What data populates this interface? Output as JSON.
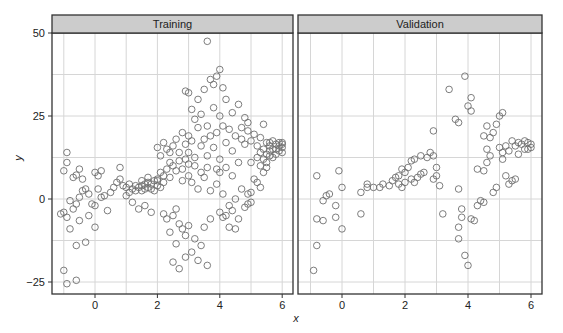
{
  "chart_data": {
    "type": "scatter",
    "title": "",
    "xlabel": "x",
    "ylabel": "y",
    "xlim": [
      -1.3,
      6.3
    ],
    "ylim": [
      -30,
      51
    ],
    "x_ticks": [
      0,
      2,
      4,
      6
    ],
    "y_ticks": [
      -25,
      0,
      25,
      50
    ],
    "grid": true,
    "legend": null,
    "panels": [
      {
        "name": "Training",
        "points": [
          [
            -1.0,
            8.5
          ],
          [
            -0.9,
            14.0
          ],
          [
            -0.9,
            11.0
          ],
          [
            -0.7,
            6.5
          ],
          [
            -0.6,
            7.2
          ],
          [
            -0.5,
            9.0
          ],
          [
            -0.4,
            6.0
          ],
          [
            -0.8,
            -0.5
          ],
          [
            -0.6,
            -1.5
          ],
          [
            -0.5,
            0.5
          ],
          [
            -1.0,
            -4.0
          ],
          [
            -1.1,
            -4.5
          ],
          [
            -0.9,
            -5.5
          ],
          [
            -0.7,
            -3.0
          ],
          [
            -0.5,
            -6.5
          ],
          [
            -0.8,
            -9.0
          ],
          [
            -0.6,
            -14.0
          ],
          [
            -0.3,
            -13.0
          ],
          [
            -1.0,
            -21.5
          ],
          [
            -0.9,
            -25.5
          ],
          [
            -0.6,
            -24.5
          ],
          [
            -0.4,
            2.5
          ],
          [
            -0.3,
            3.0
          ],
          [
            -0.2,
            1.5
          ],
          [
            -0.1,
            -1.5
          ],
          [
            0.0,
            -2.0
          ],
          [
            0.0,
            8.0
          ],
          [
            0.1,
            7.0
          ],
          [
            0.2,
            8.5
          ],
          [
            0.1,
            3.0
          ],
          [
            -0.2,
            -5.0
          ],
          [
            0.0,
            -8.5
          ],
          [
            0.2,
            0.5
          ],
          [
            0.3,
            1.0
          ],
          [
            0.4,
            -3.5
          ],
          [
            0.5,
            2.0
          ],
          [
            0.6,
            3.5
          ],
          [
            0.7,
            5.0
          ],
          [
            0.8,
            6.0
          ],
          [
            0.9,
            4.0
          ],
          [
            0.8,
            9.5
          ],
          [
            1.0,
            1.0
          ],
          [
            1.1,
            2.0
          ],
          [
            1.2,
            3.0
          ],
          [
            1.3,
            2.5
          ],
          [
            1.4,
            3.5
          ],
          [
            1.5,
            4.0
          ],
          [
            1.6,
            3.0
          ],
          [
            1.7,
            5.0
          ],
          [
            1.8,
            4.5
          ],
          [
            1.2,
            -1.0
          ],
          [
            1.4,
            -3.0
          ],
          [
            1.6,
            -2.0
          ],
          [
            1.8,
            -4.0
          ],
          [
            1.7,
            6.5
          ],
          [
            1.9,
            5.5
          ],
          [
            2.0,
            6.0
          ],
          [
            2.0,
            4.0
          ],
          [
            2.1,
            3.5
          ],
          [
            2.2,
            5.0
          ],
          [
            2.1,
            8.0
          ],
          [
            2.2,
            7.0
          ],
          [
            2.3,
            9.0
          ],
          [
            2.4,
            6.5
          ],
          [
            2.5,
            10.0
          ],
          [
            2.6,
            8.5
          ],
          [
            2.7,
            11.5
          ],
          [
            2.8,
            9.0
          ],
          [
            2.9,
            12.0
          ],
          [
            3.0,
            10.5
          ],
          [
            2.1,
            13.0
          ],
          [
            2.3,
            15.0
          ],
          [
            2.2,
            17.0
          ],
          [
            2.4,
            14.0
          ],
          [
            2.6,
            18.0
          ],
          [
            2.8,
            20.0
          ],
          [
            2.9,
            16.5
          ],
          [
            3.0,
            19.0
          ],
          [
            2.0,
            15.5
          ],
          [
            2.5,
            16.0
          ],
          [
            2.2,
            -4.5
          ],
          [
            2.3,
            -6.0
          ],
          [
            2.5,
            -5.0
          ],
          [
            2.6,
            -3.0
          ],
          [
            2.7,
            -7.5
          ],
          [
            2.8,
            -9.0
          ],
          [
            2.4,
            -10.0
          ],
          [
            2.6,
            -13.5
          ],
          [
            2.9,
            -11.0
          ],
          [
            3.0,
            -8.0
          ],
          [
            2.5,
            -19.0
          ],
          [
            2.7,
            -21.0
          ],
          [
            2.9,
            -17.5
          ],
          [
            3.1,
            -16.0
          ],
          [
            3.2,
            -12.0
          ],
          [
            3.3,
            -18.5
          ],
          [
            3.4,
            -14.0
          ],
          [
            3.6,
            -20.0
          ],
          [
            3.5,
            -8.5
          ],
          [
            3.7,
            -6.0
          ],
          [
            2.9,
            32.5
          ],
          [
            3.0,
            32.0
          ],
          [
            3.3,
            30.0
          ],
          [
            3.5,
            33.0
          ],
          [
            3.6,
            47.5
          ],
          [
            3.7,
            36.0
          ],
          [
            3.9,
            37.0
          ],
          [
            4.0,
            39.0
          ],
          [
            3.8,
            34.5
          ],
          [
            4.1,
            33.5
          ],
          [
            3.1,
            27.0
          ],
          [
            3.2,
            24.0
          ],
          [
            3.4,
            25.5
          ],
          [
            3.6,
            22.0
          ],
          [
            3.8,
            27.5
          ],
          [
            4.0,
            25.0
          ],
          [
            4.2,
            30.0
          ],
          [
            4.4,
            26.0
          ],
          [
            4.6,
            28.5
          ],
          [
            4.8,
            24.5
          ],
          [
            3.0,
            14.0
          ],
          [
            3.2,
            12.5
          ],
          [
            3.4,
            16.0
          ],
          [
            3.6,
            13.0
          ],
          [
            3.8,
            15.5
          ],
          [
            4.0,
            12.0
          ],
          [
            4.2,
            17.0
          ],
          [
            4.4,
            14.5
          ],
          [
            4.6,
            11.0
          ],
          [
            4.8,
            16.5
          ],
          [
            3.1,
            5.0
          ],
          [
            3.3,
            3.0
          ],
          [
            3.5,
            6.5
          ],
          [
            3.7,
            2.5
          ],
          [
            3.9,
            4.5
          ],
          [
            4.1,
            1.5
          ],
          [
            4.3,
            -2.0
          ],
          [
            4.5,
            0.0
          ],
          [
            4.7,
            3.0
          ],
          [
            4.9,
            -1.5
          ],
          [
            4.0,
            -4.0
          ],
          [
            4.2,
            -5.0
          ],
          [
            4.4,
            -3.5
          ],
          [
            4.6,
            -6.0
          ],
          [
            4.5,
            -9.0
          ],
          [
            4.3,
            -8.5
          ],
          [
            4.1,
            -5.5
          ],
          [
            4.8,
            -2.5
          ],
          [
            5.0,
            -1.0
          ],
          [
            4.9,
            1.5
          ],
          [
            4.5,
            19.0
          ],
          [
            4.7,
            18.0
          ],
          [
            4.9,
            20.5
          ],
          [
            5.0,
            17.5
          ],
          [
            5.1,
            19.5
          ],
          [
            5.2,
            16.0
          ],
          [
            5.3,
            18.5
          ],
          [
            5.4,
            15.0
          ],
          [
            5.5,
            17.0
          ],
          [
            5.6,
            14.5
          ],
          [
            5.0,
            11.0
          ],
          [
            5.2,
            12.5
          ],
          [
            5.3,
            10.0
          ],
          [
            5.4,
            8.0
          ],
          [
            5.5,
            9.5
          ],
          [
            5.1,
            6.0
          ],
          [
            5.2,
            5.0
          ],
          [
            5.3,
            3.5
          ],
          [
            5.0,
            2.0
          ],
          [
            5.4,
            22.5
          ],
          [
            5.6,
            16.0
          ],
          [
            5.7,
            15.0
          ],
          [
            5.8,
            16.5
          ],
          [
            5.9,
            17.0
          ],
          [
            6.0,
            15.5
          ],
          [
            6.0,
            16.5
          ],
          [
            5.9,
            14.5
          ],
          [
            5.8,
            15.0
          ],
          [
            5.7,
            17.5
          ],
          [
            5.6,
            13.0
          ],
          [
            6.0,
            14.0
          ],
          [
            5.9,
            16.0
          ],
          [
            5.8,
            13.5
          ],
          [
            5.7,
            12.5
          ],
          [
            6.0,
            17.0
          ],
          [
            5.5,
            13.5
          ],
          [
            5.6,
            17.0
          ],
          [
            5.4,
            12.0
          ],
          [
            5.5,
            11.0
          ],
          [
            5.3,
            14.0
          ],
          [
            1.0,
            3.5
          ],
          [
            1.1,
            4.5
          ],
          [
            1.3,
            4.0
          ],
          [
            1.5,
            5.5
          ],
          [
            1.6,
            4.5
          ],
          [
            1.8,
            3.0
          ],
          [
            1.9,
            2.5
          ],
          [
            2.0,
            5.5
          ],
          [
            1.7,
            3.5
          ],
          [
            1.5,
            2.5
          ],
          [
            3.9,
            20.0
          ],
          [
            4.1,
            22.0
          ],
          [
            4.3,
            21.0
          ],
          [
            3.7,
            19.0
          ],
          [
            3.5,
            18.0
          ],
          [
            3.3,
            21.5
          ],
          [
            3.1,
            17.5
          ],
          [
            4.7,
            21.5
          ],
          [
            4.9,
            23.0
          ],
          [
            3.9,
            9.0
          ],
          [
            4.0,
            8.0
          ],
          [
            4.2,
            9.5
          ],
          [
            4.4,
            7.0
          ],
          [
            3.6,
            9.5
          ],
          [
            3.4,
            8.0
          ],
          [
            3.2,
            10.0
          ],
          [
            3.0,
            7.0
          ],
          [
            2.8,
            5.5
          ],
          [
            2.7,
            14.0
          ],
          [
            2.4,
            11.0
          ]
        ]
      },
      {
        "name": "Validation",
        "points": [
          [
            -0.9,
            -21.5
          ],
          [
            -0.8,
            -14.0
          ],
          [
            -0.8,
            -6.0
          ],
          [
            -0.6,
            -6.5
          ],
          [
            -0.5,
            1.0
          ],
          [
            -0.4,
            1.5
          ],
          [
            -0.6,
            -0.5
          ],
          [
            -0.8,
            7.0
          ],
          [
            -0.2,
            -2.0
          ],
          [
            -0.2,
            -5.5
          ],
          [
            -0.1,
            8.5
          ],
          [
            0.0,
            -9.0
          ],
          [
            0.0,
            3.5
          ],
          [
            0.6,
            -4.5
          ],
          [
            0.6,
            2.0
          ],
          [
            0.8,
            3.5
          ],
          [
            0.8,
            4.5
          ],
          [
            1.0,
            3.5
          ],
          [
            1.2,
            3.5
          ],
          [
            1.3,
            4.5
          ],
          [
            1.5,
            4.0
          ],
          [
            1.6,
            5.5
          ],
          [
            1.7,
            6.5
          ],
          [
            1.8,
            4.5
          ],
          [
            1.9,
            3.5
          ],
          [
            2.0,
            5.0
          ],
          [
            1.8,
            7.0
          ],
          [
            2.0,
            8.0
          ],
          [
            1.9,
            9.0
          ],
          [
            2.1,
            9.5
          ],
          [
            2.2,
            6.0
          ],
          [
            2.3,
            5.0
          ],
          [
            2.4,
            6.5
          ],
          [
            2.5,
            7.5
          ],
          [
            2.6,
            8.0
          ],
          [
            2.2,
            11.5
          ],
          [
            2.3,
            12.0
          ],
          [
            2.5,
            13.0
          ],
          [
            2.7,
            12.5
          ],
          [
            2.8,
            14.0
          ],
          [
            2.9,
            20.5
          ],
          [
            2.9,
            13.0
          ],
          [
            3.0,
            9.5
          ],
          [
            2.9,
            6.0
          ],
          [
            3.0,
            7.0
          ],
          [
            3.1,
            4.0
          ],
          [
            3.2,
            -4.5
          ],
          [
            3.4,
            33.0
          ],
          [
            3.6,
            24.0
          ],
          [
            3.7,
            23.0
          ],
          [
            3.7,
            3.0
          ],
          [
            3.8,
            -3.0
          ],
          [
            3.8,
            -5.5
          ],
          [
            3.9,
            37.0
          ],
          [
            4.0,
            28.0
          ],
          [
            4.1,
            26.5
          ],
          [
            4.1,
            30.5
          ],
          [
            3.7,
            -8.5
          ],
          [
            3.7,
            -12.0
          ],
          [
            3.9,
            -17.0
          ],
          [
            4.0,
            -20.0
          ],
          [
            4.1,
            -6.0
          ],
          [
            4.2,
            -6.5
          ],
          [
            4.3,
            -2.0
          ],
          [
            4.4,
            -0.5
          ],
          [
            4.5,
            -1.0
          ],
          [
            4.3,
            9.0
          ],
          [
            4.5,
            8.5
          ],
          [
            4.6,
            11.0
          ],
          [
            4.7,
            13.0
          ],
          [
            4.6,
            15.0
          ],
          [
            4.7,
            18.5
          ],
          [
            4.8,
            20.0
          ],
          [
            4.9,
            22.5
          ],
          [
            5.0,
            25.0
          ],
          [
            5.1,
            26.0
          ],
          [
            5.0,
            15.5
          ],
          [
            5.1,
            12.0
          ],
          [
            5.2,
            16.0
          ],
          [
            5.3,
            14.5
          ],
          [
            5.4,
            17.5
          ],
          [
            5.5,
            16.0
          ],
          [
            5.6,
            17.0
          ],
          [
            5.7,
            16.5
          ],
          [
            5.8,
            15.0
          ],
          [
            5.9,
            17.0
          ],
          [
            6.0,
            16.5
          ],
          [
            6.0,
            15.5
          ],
          [
            5.9,
            15.0
          ],
          [
            5.2,
            7.0
          ],
          [
            5.3,
            4.5
          ],
          [
            5.4,
            5.5
          ],
          [
            5.5,
            6.0
          ],
          [
            4.9,
            3.5
          ],
          [
            4.8,
            2.0
          ],
          [
            4.6,
            22.0
          ],
          [
            4.5,
            19.0
          ],
          [
            5.8,
            17.5
          ],
          [
            5.6,
            13.5
          ],
          [
            5.1,
            14.0
          ]
        ]
      }
    ]
  },
  "colors": {
    "strip_fill": "#cccccc",
    "panel_border": "#333333",
    "grid": "#d6d6d6",
    "point_stroke": "#6e6e6e",
    "text": "#222222"
  }
}
